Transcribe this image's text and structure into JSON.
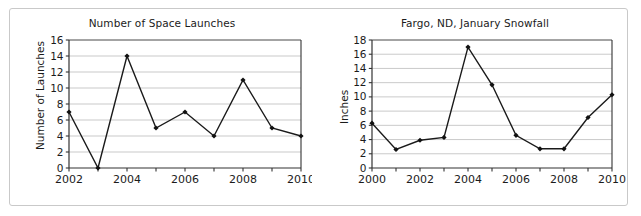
{
  "page": {
    "background_color": "#ffffff",
    "frame_color": "#c9c9c9"
  },
  "chart_data": [
    {
      "id": "space-launches",
      "type": "line",
      "title": "Number of Space Launches",
      "xlabel": "",
      "ylabel": "Number of Launches",
      "x": [
        2002,
        2003,
        2004,
        2005,
        2006,
        2007,
        2008,
        2009,
        2010
      ],
      "values": [
        7,
        0,
        14,
        5,
        7,
        4,
        11,
        5,
        4
      ],
      "xlim": [
        2002,
        2010
      ],
      "ylim": [
        0,
        16
      ],
      "ytick_step": 2,
      "yticks": [
        0,
        2,
        4,
        6,
        8,
        10,
        12,
        14,
        16
      ],
      "ytick_labels": [
        "0",
        "2",
        "4",
        "6",
        "8",
        "10",
        "12",
        "14",
        "16"
      ],
      "xticks": [
        2002,
        2003,
        2004,
        2005,
        2006,
        2007,
        2008,
        2009,
        2010
      ],
      "xtick_labels_shown": [
        "2002",
        "2004",
        "2006",
        "2008",
        "2010"
      ],
      "xtick_labels_shown_values": [
        2002,
        2004,
        2006,
        2008,
        2010
      ],
      "grid": "horizontal",
      "grid_color": "#b3b3b3",
      "line_color": "#1a1a1a",
      "marker": "diamond",
      "marker_color": "#111111",
      "legend": "none"
    },
    {
      "id": "fargo-snowfall",
      "type": "line",
      "title": "Fargo, ND, January Snowfall",
      "xlabel": "",
      "ylabel": "Inches",
      "x": [
        2000,
        2001,
        2002,
        2003,
        2004,
        2005,
        2006,
        2007,
        2008,
        2009,
        2010
      ],
      "values": [
        6.3,
        2.6,
        3.9,
        4.3,
        17.0,
        11.7,
        4.6,
        2.7,
        2.7,
        7.1,
        10.3
      ],
      "xlim": [
        2000,
        2010
      ],
      "ylim": [
        0,
        18
      ],
      "ytick_step": 2,
      "yticks": [
        0,
        2,
        4,
        6,
        8,
        10,
        12,
        14,
        16,
        18
      ],
      "ytick_labels": [
        "0",
        "2",
        "4",
        "6",
        "8",
        "10",
        "12",
        "14",
        "16",
        "18"
      ],
      "xticks": [
        2000,
        2001,
        2002,
        2003,
        2004,
        2005,
        2006,
        2007,
        2008,
        2009,
        2010
      ],
      "xtick_labels_shown": [
        "2000",
        "2002",
        "2004",
        "2006",
        "2008",
        "2010"
      ],
      "xtick_labels_shown_values": [
        2000,
        2002,
        2004,
        2006,
        2008,
        2010
      ],
      "grid": "horizontal",
      "grid_color": "#b3b3b3",
      "line_color": "#1a1a1a",
      "marker": "diamond",
      "marker_color": "#111111",
      "legend": "none"
    }
  ]
}
